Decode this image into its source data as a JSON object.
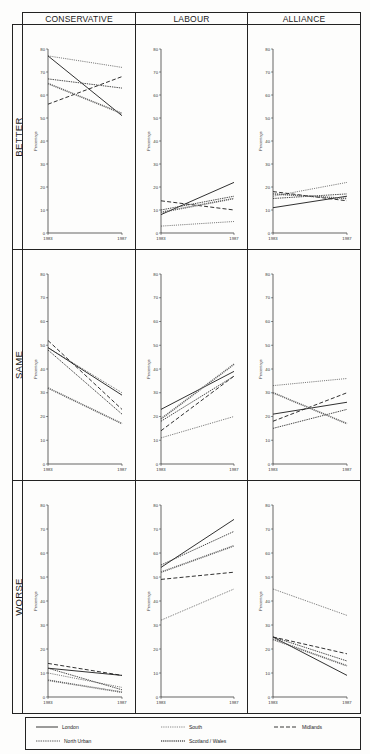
{
  "columns": [
    "CONSERVATIVE",
    "LABOUR",
    "ALLIANCE"
  ],
  "rows": [
    "BETTER",
    "SAME",
    "WORSE"
  ],
  "axis": {
    "ylabel": "Percentage",
    "yticks": [
      0,
      10,
      20,
      30,
      40,
      50,
      60,
      70,
      80
    ],
    "xticks": [
      "1983",
      "1987"
    ]
  },
  "legend": [
    {
      "name": "London",
      "style": "solid"
    },
    {
      "name": "South",
      "style": "dotted"
    },
    {
      "name": "Midlands",
      "style": "dashed"
    },
    {
      "name": "North Urban",
      "style": "dotted-fine"
    },
    {
      "name": "Scotland / Wales",
      "style": "thick-dotted"
    }
  ],
  "chart_data": [
    {
      "type": "line",
      "party": "Conservative",
      "outcome": "Better",
      "x": [
        "1983",
        "1987"
      ],
      "ylabel": "Percentage",
      "ylim": [
        0,
        80
      ],
      "series": [
        {
          "name": "London",
          "values": [
            77,
            51
          ]
        },
        {
          "name": "South",
          "values": [
            77,
            72
          ]
        },
        {
          "name": "Midlands",
          "values": [
            56,
            68
          ]
        },
        {
          "name": "North Urban",
          "values": [
            67,
            63
          ]
        },
        {
          "name": "Scotland / Wales",
          "values": [
            65,
            52
          ]
        }
      ]
    },
    {
      "type": "line",
      "party": "Labour",
      "outcome": "Better",
      "x": [
        "1983",
        "1987"
      ],
      "ylabel": "Percentage",
      "ylim": [
        0,
        80
      ],
      "series": [
        {
          "name": "London",
          "values": [
            8,
            22
          ]
        },
        {
          "name": "South",
          "values": [
            3,
            5
          ]
        },
        {
          "name": "Midlands",
          "values": [
            14,
            10
          ]
        },
        {
          "name": "North Urban",
          "values": [
            10,
            16
          ]
        },
        {
          "name": "Scotland / Wales",
          "values": [
            9,
            15
          ]
        }
      ]
    },
    {
      "type": "line",
      "party": "Alliance",
      "outcome": "Better",
      "x": [
        "1983",
        "1987"
      ],
      "ylabel": "Percentage",
      "ylim": [
        0,
        80
      ],
      "series": [
        {
          "name": "London",
          "values": [
            11,
            16
          ]
        },
        {
          "name": "South",
          "values": [
            16,
            22
          ]
        },
        {
          "name": "Midlands",
          "values": [
            18,
            14
          ]
        },
        {
          "name": "North Urban",
          "values": [
            15,
            17
          ]
        },
        {
          "name": "Scotland / Wales",
          "values": [
            17,
            15
          ]
        }
      ]
    },
    {
      "type": "line",
      "party": "Conservative",
      "outcome": "Same",
      "x": [
        "1983",
        "1987"
      ],
      "ylabel": "Percentage",
      "ylim": [
        0,
        80
      ],
      "series": [
        {
          "name": "London",
          "values": [
            49,
            29
          ]
        },
        {
          "name": "South",
          "values": [
            49,
            30
          ]
        },
        {
          "name": "Midlands",
          "values": [
            52,
            23
          ]
        },
        {
          "name": "North Urban",
          "values": [
            48,
            21
          ]
        },
        {
          "name": "Scotland / Wales",
          "values": [
            32,
            17
          ]
        }
      ]
    },
    {
      "type": "line",
      "party": "Labour",
      "outcome": "Same",
      "x": [
        "1983",
        "1987"
      ],
      "ylabel": "Percentage",
      "ylim": [
        0,
        80
      ],
      "series": [
        {
          "name": "London",
          "values": [
            23,
            39
          ]
        },
        {
          "name": "South",
          "values": [
            11,
            20
          ]
        },
        {
          "name": "Midlands",
          "values": [
            14,
            37
          ]
        },
        {
          "name": "North Urban",
          "values": [
            18,
            37
          ]
        },
        {
          "name": "Scotland / Wales",
          "values": [
            19,
            42
          ]
        }
      ]
    },
    {
      "type": "line",
      "party": "Alliance",
      "outcome": "Same",
      "x": [
        "1983",
        "1987"
      ],
      "ylabel": "Percentage",
      "ylim": [
        0,
        80
      ],
      "series": [
        {
          "name": "London",
          "values": [
            21,
            26
          ]
        },
        {
          "name": "South",
          "values": [
            33,
            36
          ]
        },
        {
          "name": "Midlands",
          "values": [
            18,
            30
          ]
        },
        {
          "name": "North Urban",
          "values": [
            15,
            23
          ]
        },
        {
          "name": "Scotland / Wales",
          "values": [
            30,
            17
          ]
        }
      ]
    },
    {
      "type": "line",
      "party": "Conservative",
      "outcome": "Worse",
      "x": [
        "1983",
        "1987"
      ],
      "ylabel": "Percentage",
      "ylim": [
        0,
        80
      ],
      "series": [
        {
          "name": "London",
          "values": [
            12,
            9
          ]
        },
        {
          "name": "South",
          "values": [
            10,
            4
          ]
        },
        {
          "name": "Midlands",
          "values": [
            14,
            9
          ]
        },
        {
          "name": "North Urban",
          "values": [
            12,
            3
          ]
        },
        {
          "name": "Scotland / Wales",
          "values": [
            7,
            2
          ]
        }
      ]
    },
    {
      "type": "line",
      "party": "Labour",
      "outcome": "Worse",
      "x": [
        "1983",
        "1987"
      ],
      "ylabel": "Percentage",
      "ylim": [
        0,
        80
      ],
      "series": [
        {
          "name": "London",
          "values": [
            54,
            74
          ]
        },
        {
          "name": "South",
          "values": [
            32,
            45
          ]
        },
        {
          "name": "Midlands",
          "values": [
            49,
            52
          ]
        },
        {
          "name": "North Urban",
          "values": [
            55,
            69
          ]
        },
        {
          "name": "Scotland / Wales",
          "values": [
            52,
            63
          ]
        }
      ]
    },
    {
      "type": "line",
      "party": "Alliance",
      "outcome": "Worse",
      "x": [
        "1983",
        "1987"
      ],
      "ylabel": "Percentage",
      "ylim": [
        0,
        80
      ],
      "series": [
        {
          "name": "London",
          "values": [
            25,
            9
          ]
        },
        {
          "name": "South",
          "values": [
            45,
            34
          ]
        },
        {
          "name": "Midlands",
          "values": [
            25,
            18
          ]
        },
        {
          "name": "North Urban",
          "values": [
            25,
            15
          ]
        },
        {
          "name": "Scotland / Wales",
          "values": [
            24,
            13
          ]
        }
      ]
    }
  ]
}
